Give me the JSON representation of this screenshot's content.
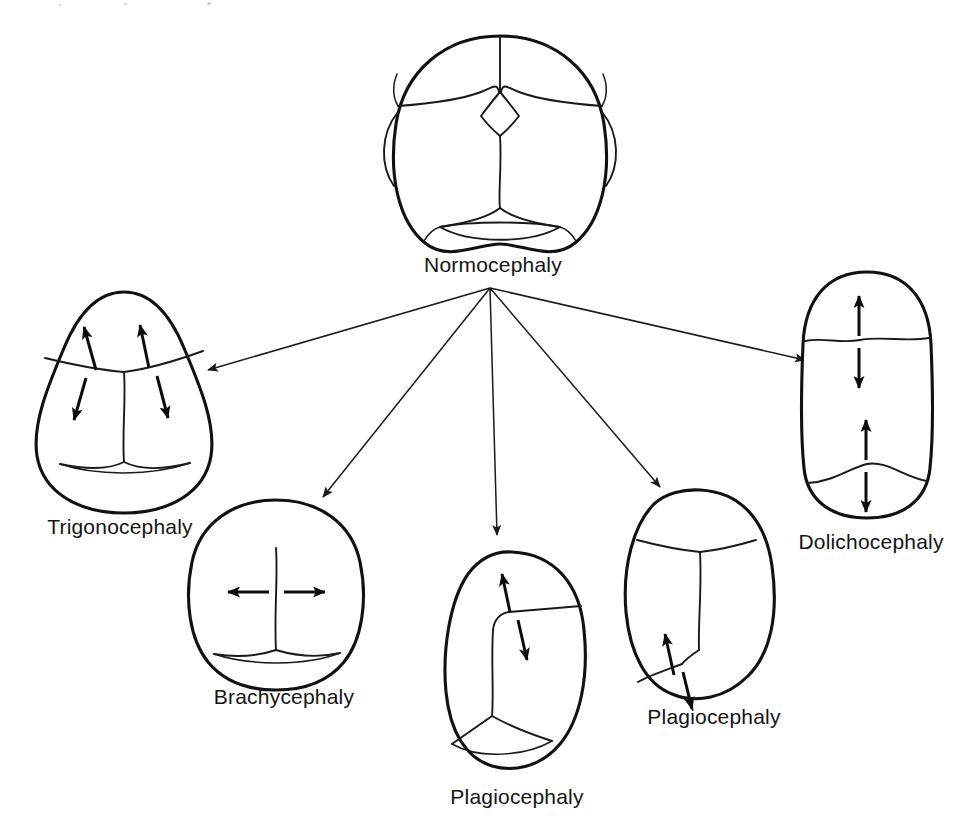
{
  "figure": {
    "kind": "medical-diagram",
    "background_color": "#ffffff",
    "ink_color": "#111111",
    "width": 964,
    "height": 836
  },
  "root_node": {
    "label": "Normocephaly",
    "label_x": 489,
    "label_y": 253,
    "skull_center_x": 500,
    "skull_center_y": 143,
    "description": "normal skull vertex view with patent sutures and open anterior and posterior fontanelles"
  },
  "branches": [
    {
      "id": "trigonocephaly",
      "label": "Trigonocephaly",
      "label_x": 118,
      "label_y": 515,
      "skull_center_x": 124,
      "skull_center_y": 400,
      "fused_suture": "metopic",
      "growth_arrows": 4,
      "arrow_orientation": "paired-oblique",
      "arrow_target_x": 208,
      "arrow_target_y": 370
    },
    {
      "id": "brachycephaly",
      "label": "Brachycephaly",
      "label_x": 283,
      "label_y": 685,
      "skull_center_x": 276,
      "skull_center_y": 592,
      "fused_suture": "bilateral-coronal",
      "growth_arrows": 2,
      "arrow_orientation": "horizontal-outward",
      "arrow_target_x": 323,
      "arrow_target_y": 497
    },
    {
      "id": "plagiocephaly-center",
      "label": "Plagiocephaly",
      "label_x": 517,
      "label_y": 785,
      "skull_center_x": 518,
      "skull_center_y": 655,
      "fused_suture": "unilateral-anterior-coronal",
      "growth_arrows": 2,
      "arrow_orientation": "vertical-opposed",
      "arrow_target_x": 497,
      "arrow_target_y": 535
    },
    {
      "id": "plagiocephaly-right",
      "label": "Plagiocephaly",
      "label_x": 712,
      "label_y": 705,
      "skull_center_x": 702,
      "skull_center_y": 594,
      "fused_suture": "unilateral-lambdoid",
      "growth_arrows": 2,
      "arrow_orientation": "oblique-opposed",
      "arrow_target_x": 660,
      "arrow_target_y": 487
    },
    {
      "id": "dolichocephaly",
      "label": "Dolichocephaly",
      "label_x": 869,
      "label_y": 530,
      "skull_center_x": 867,
      "skull_center_y": 396,
      "fused_suture": "sagittal",
      "growth_arrows": 4,
      "arrow_orientation": "vertical-opposed-pairs",
      "arrow_target_x": 805,
      "arrow_target_y": 360
    }
  ],
  "flow": {
    "origin_x": 490,
    "origin_y": 288,
    "arrow_count": 5,
    "style": "straight-line-with-solid-arrowhead"
  },
  "labels": {
    "normocephaly": "Normocephaly",
    "trigonocephaly": "Trigonocephaly",
    "brachycephaly": "Brachycephaly",
    "plagiocephaly_center": "Plagiocephaly",
    "plagiocephaly_right": "Plagiocephaly",
    "dolichocephaly": "Dolichocephaly"
  }
}
